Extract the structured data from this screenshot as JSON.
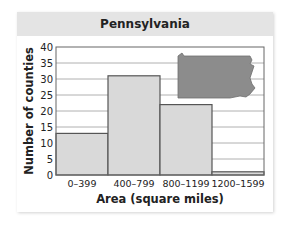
{
  "chart_data": {
    "type": "bar",
    "title": "Pennsylvania",
    "xlabel": "Area (square miles)",
    "ylabel": "Number of counties",
    "categories": [
      "0–399",
      "400–799",
      "800–1199",
      "1200–1599"
    ],
    "values": [
      13,
      31,
      22,
      1
    ],
    "ylim": [
      0,
      40
    ],
    "yticks": [
      0,
      5,
      10,
      15,
      20,
      25,
      30,
      35,
      40
    ],
    "grid": true,
    "legend": null,
    "histogram": true,
    "annotation": "Pennsylvania state outline silhouette"
  },
  "colors": {
    "bar_fill": "#d9d9d9",
    "bar_stroke": "#555555",
    "grid": "#b0b0b0",
    "title_band": "#e4e4e4",
    "state_fill": "#8c8c8c"
  }
}
